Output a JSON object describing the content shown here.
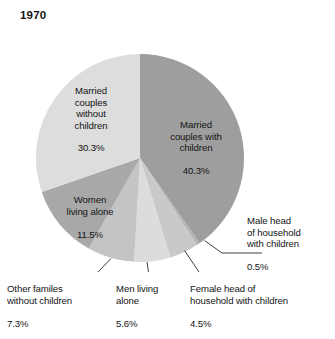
{
  "chart_data": {
    "type": "pie",
    "title": "1970",
    "xlabel": "",
    "ylabel": "",
    "legend_position": "none",
    "grid": false,
    "units": "percent",
    "start_angle_deg": 0,
    "direction": "clockwise",
    "categories": [
      "Married couples with children",
      "Male head of household with children",
      "Female head of household with children",
      "Men living alone",
      "Other familes without children",
      "Women living alone",
      "Married couples without children"
    ],
    "values": [
      40.3,
      0.5,
      4.5,
      5.6,
      7.3,
      11.5,
      30.3
    ],
    "slices": [
      {
        "id": "married-couples-with-children",
        "label": "Married\ncouples with\nchildren",
        "value": 40.3,
        "value_text": "40.3%",
        "color": "#9e9e9e",
        "label_placement": "inside"
      },
      {
        "id": "male-head-of-household-with-children",
        "label": "Male head\nof household\nwith children",
        "value": 0.5,
        "value_text": "0.5%",
        "color": "#b5b5b5",
        "label_placement": "outside-right"
      },
      {
        "id": "female-head-of-household-with-children",
        "label": "Female head of\nhousehold with children",
        "value": 4.5,
        "value_text": "4.5%",
        "color": "#c9c9c9",
        "label_placement": "outside-bottom"
      },
      {
        "id": "men-living-alone",
        "label": "Men living\nalone",
        "value": 5.6,
        "value_text": "5.6%",
        "color": "#dcdcdc",
        "label_placement": "outside-bottom"
      },
      {
        "id": "other-familes-without-children",
        "label": "Other familes\nwithout children",
        "value": 7.3,
        "value_text": "7.3%",
        "color": "#c4c4c4",
        "label_placement": "outside-bottom"
      },
      {
        "id": "women-living-alone",
        "label": "Women\nliving alone",
        "value": 11.5,
        "value_text": "11.5%",
        "color": "#a8a8a8",
        "label_placement": "inside"
      },
      {
        "id": "married-couples-without-children",
        "label": "Married\ncouples\nwithout\nchildren",
        "value": 30.3,
        "value_text": "30.3%",
        "color": "#dddddd",
        "label_placement": "inside"
      }
    ],
    "geometry": {
      "center_x": 140,
      "center_y": 158,
      "radius": 104
    },
    "background_color": "#ffffff",
    "text_color": "#141414"
  }
}
